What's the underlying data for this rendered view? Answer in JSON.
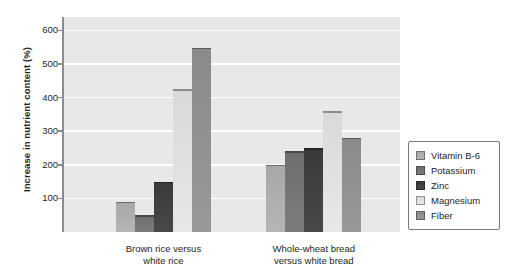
{
  "chart_data": {
    "type": "bar",
    "title": "",
    "xlabel": "",
    "ylabel": "Increase in nutrient content (%)",
    "ylim": [
      0,
      640
    ],
    "yticks": [
      100,
      200,
      300,
      400,
      500,
      600
    ],
    "ytick_labels": [
      "100",
      "200",
      "300",
      "400",
      "500",
      "600"
    ],
    "grid": true,
    "legend_position": "right-outside",
    "categories": [
      "Brown rice versus\nwhite rice",
      "Whole-wheat bread\nversus white bread"
    ],
    "series": [
      {
        "name": "Vitamin B-6",
        "color": "#a8a8a8",
        "values": [
          90,
          200
        ]
      },
      {
        "name": "Potassium",
        "color": "#6e6e6e",
        "values": [
          50,
          240
        ]
      },
      {
        "name": "Zinc",
        "color": "#3a3a3a",
        "values": [
          150,
          250
        ]
      },
      {
        "name": "Magnesium",
        "color": "#d9d9d9",
        "values": [
          425,
          360
        ]
      },
      {
        "name": "Fiber",
        "color": "#8a8a8a",
        "values": [
          548,
          280
        ]
      }
    ]
  },
  "style": {
    "plot_background": "#e8e8e8",
    "gridline_color": "#ffffff",
    "axis_color": "#8c8c8c",
    "text_color": "#231f20",
    "legend_border": "#7a7a7a",
    "legend_background": "#ffffff"
  }
}
